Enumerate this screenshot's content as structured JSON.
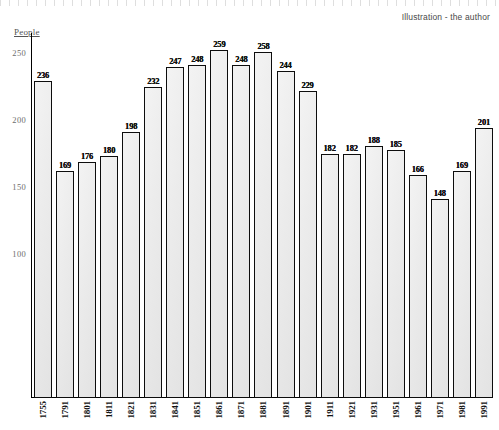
{
  "credit": "Illustration - the author",
  "axis": {
    "y_title": "People",
    "y_ticks": [
      "250",
      "200",
      "150",
      "100"
    ]
  },
  "chart_data": {
    "type": "bar",
    "title": "",
    "subtitle": "",
    "xlabel": "",
    "ylabel": "People",
    "ylim": [
      0,
      272
    ],
    "grid": false,
    "legend": null,
    "annotations": [
      "Illustration - the author"
    ],
    "tick_labels_y": [
      250,
      200,
      150,
      100
    ],
    "categories": [
      "1755",
      "1791",
      "1801",
      "1811",
      "1821",
      "1831",
      "1841",
      "1851",
      "1861",
      "1871",
      "1881",
      "1891",
      "1901",
      "1911",
      "1921",
      "1931",
      "1951",
      "1961",
      "1971",
      "1981",
      "1991"
    ],
    "values": [
      236,
      169,
      176,
      180,
      198,
      232,
      247,
      248,
      259,
      248,
      258,
      244,
      229,
      182,
      182,
      188,
      185,
      166,
      148,
      169,
      201
    ],
    "bars": [
      {
        "year": "1755",
        "value": 236
      },
      {
        "year": "1791",
        "value": 169
      },
      {
        "year": "1801",
        "value": 176
      },
      {
        "year": "1811",
        "value": 180
      },
      {
        "year": "1821",
        "value": 198
      },
      {
        "year": "1831",
        "value": 232
      },
      {
        "year": "1841",
        "value": 247
      },
      {
        "year": "1851",
        "value": 248
      },
      {
        "year": "1861",
        "value": 259
      },
      {
        "year": "1871",
        "value": 248
      },
      {
        "year": "1881",
        "value": 258
      },
      {
        "year": "1891",
        "value": 244
      },
      {
        "year": "1901",
        "value": 229
      },
      {
        "year": "1911",
        "value": 182
      },
      {
        "year": "1921",
        "value": 182
      },
      {
        "year": "1931",
        "value": 188
      },
      {
        "year": "1951",
        "value": 185
      },
      {
        "year": "1961",
        "value": 166
      },
      {
        "year": "1971",
        "value": 148
      },
      {
        "year": "1981",
        "value": 169
      },
      {
        "year": "1991",
        "value": 201
      }
    ]
  }
}
